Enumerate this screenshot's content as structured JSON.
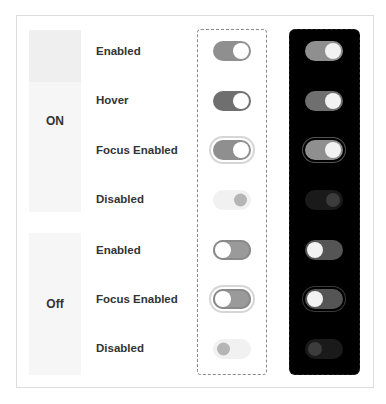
{
  "groups": {
    "on": {
      "label": "ON"
    },
    "off": {
      "label": "Off"
    }
  },
  "rows": [
    {
      "label": "Enabled",
      "group": "on",
      "state": "enabled"
    },
    {
      "label": "Hover",
      "group": "on",
      "state": "hover"
    },
    {
      "label": "Focus Enabled",
      "group": "on",
      "state": "focus"
    },
    {
      "label": "Disabled",
      "group": "on",
      "state": "disabled"
    },
    {
      "label": "Enabled",
      "group": "off",
      "state": "enabled"
    },
    {
      "label": "Focus Enabled",
      "group": "off",
      "state": "focus"
    },
    {
      "label": "Disabled",
      "group": "off",
      "state": "disabled"
    }
  ],
  "themes": [
    "light",
    "dark"
  ],
  "colors": {
    "track_on": "#8f8f8f",
    "track_on_hover": "#6f6f6f",
    "track_disabled_light": "#f1f1f1",
    "track_disabled_dark": "#1a1a1a",
    "knob": "#ffffff",
    "dark_background": "#000000",
    "label_background": "#f6f6f6"
  }
}
